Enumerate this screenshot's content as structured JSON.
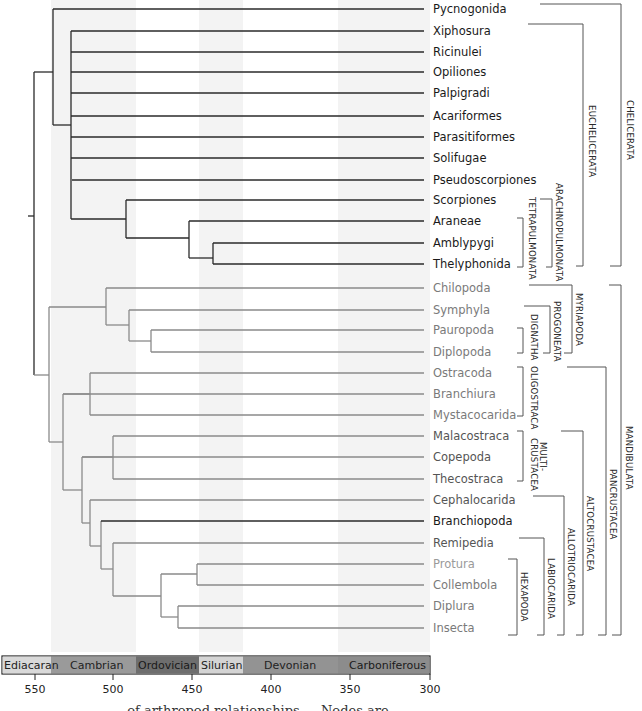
{
  "figure": {
    "type": "phylogenetic-tree",
    "timescale_label_unit": "Ma",
    "colors": {
      "chelicerate_branch": "#2a2a2a",
      "mandibulate_branch": "#8a8a8a",
      "chelicerate_label": "#1a1a1a",
      "mandibulate_label": "#7a7a7a",
      "background_band": "#f3f3f3",
      "bracket": "#555555"
    }
  },
  "taxa": [
    {
      "name": "Pycnogonida",
      "group": "chelicerata"
    },
    {
      "name": "Xiphosura",
      "group": "chelicerata"
    },
    {
      "name": "Ricinulei",
      "group": "chelicerata"
    },
    {
      "name": "Opiliones",
      "group": "chelicerata"
    },
    {
      "name": "Palpigradi",
      "group": "chelicerata"
    },
    {
      "name": "Acariformes",
      "group": "chelicerata"
    },
    {
      "name": "Parasitiformes",
      "group": "chelicerata"
    },
    {
      "name": "Solifugae",
      "group": "chelicerata"
    },
    {
      "name": "Pseudoscorpiones",
      "group": "chelicerata"
    },
    {
      "name": "Scorpiones",
      "group": "chelicerata"
    },
    {
      "name": "Araneae",
      "group": "chelicerata"
    },
    {
      "name": "Amblypygi",
      "group": "chelicerata"
    },
    {
      "name": "Thelyphonida",
      "group": "chelicerata"
    },
    {
      "name": "Chilopoda",
      "group": "mandibulata"
    },
    {
      "name": "Symphyla",
      "group": "mandibulata"
    },
    {
      "name": "Pauropoda",
      "group": "mandibulata"
    },
    {
      "name": "Diplopoda",
      "group": "mandibulata"
    },
    {
      "name": "Ostracoda",
      "group": "mandibulata"
    },
    {
      "name": "Branchiura",
      "group": "mandibulata"
    },
    {
      "name": "Mystacocarida",
      "group": "mandibulata"
    },
    {
      "name": "Malacostraca",
      "group": "mandibulata"
    },
    {
      "name": "Copepoda",
      "group": "mandibulata"
    },
    {
      "name": "Thecostraca",
      "group": "mandibulata"
    },
    {
      "name": "Cephalocarida",
      "group": "mandibulata"
    },
    {
      "name": "Branchiopoda",
      "group": "mandibulata-dark"
    },
    {
      "name": "Remipedia",
      "group": "mandibulata"
    },
    {
      "name": "Protura",
      "group": "mandibulata-light"
    },
    {
      "name": "Collembola",
      "group": "mandibulata"
    },
    {
      "name": "Diplura",
      "group": "mandibulata"
    },
    {
      "name": "Insecta",
      "group": "mandibulata"
    }
  ],
  "clades": {
    "chelicerata": "CHELICERATA",
    "euchelicerata": "EUCHELICERATA",
    "arachnopulmonata": "ARACHNOPULMONATA",
    "tetrapulmonata": "TETRAPULMONATA",
    "mandibulata": "MANDIBULATA",
    "myriapoda": "MYRIAPODA",
    "progoneata": "PROGONEATA",
    "dignatha": "DIGNATHA",
    "pancrustacea": "PANCRUSTACEA",
    "oligostraca": "OLIGOSTRACA",
    "altocrustacea": "ALTOCRUSTACEA",
    "multicrustacea_1": "MULTI-",
    "multicrustacea_2": "CRUSTACEA",
    "allotriocarida": "ALLOTRIOCARIDA",
    "labiocarida": "LABIOCARIDA",
    "hexapoda": "HEXAPODA"
  },
  "timescale": {
    "periods": [
      {
        "name": "Ediacaran",
        "color": "#d9d9d9",
        "text": "#222222"
      },
      {
        "name": "Cambrian",
        "color": "#9a9a9a",
        "text": "#222222"
      },
      {
        "name": "Ordovician",
        "color": "#6e6e6e",
        "text": "#1a1a1a"
      },
      {
        "name": "Silurian",
        "color": "#d4d4d4",
        "text": "#222222"
      },
      {
        "name": "Devonian",
        "color": "#939393",
        "text": "#222222"
      },
      {
        "name": "Carboniferous",
        "color": "#8c8c8c",
        "text": "#1a1a1a"
      }
    ],
    "ticks": [
      "550",
      "500",
      "450",
      "400",
      "350",
      "300"
    ]
  },
  "caption": {
    "visible_fragment": "… of arthropod relationships … Nodes are"
  }
}
